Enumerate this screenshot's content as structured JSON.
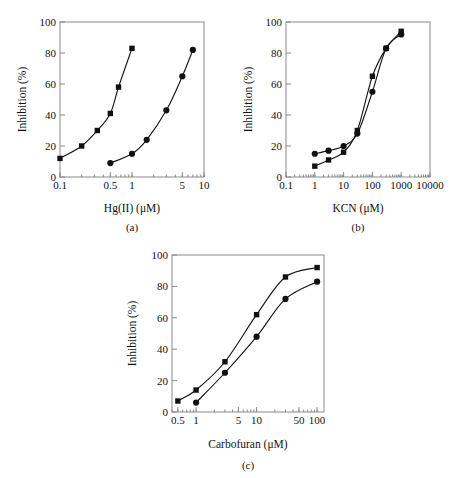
{
  "figure": {
    "ylabel": "Inhibition (%)",
    "ylim": [
      0,
      100
    ],
    "yticks": [
      0,
      20,
      40,
      60,
      80,
      100
    ]
  },
  "chart_data": [
    {
      "id": "a",
      "type": "scatter",
      "panel_label": "(a)",
      "title": "",
      "xlabel": "Hg(II) (μM)",
      "ylabel": "Inhibition (%)",
      "xscale": "log",
      "xlim": [
        0.1,
        10
      ],
      "ylim": [
        0,
        100
      ],
      "xticks": [
        0.1,
        0.5,
        1,
        5,
        10
      ],
      "xtick_labels": [
        "0.1",
        "0.5",
        "1",
        "5",
        "10"
      ],
      "yticks": [
        0,
        20,
        40,
        60,
        80,
        100
      ],
      "ytick_labels": [
        "0",
        "20",
        "40",
        "60",
        "80",
        "100"
      ],
      "grid": false,
      "legend": "none",
      "series": [
        {
          "name": "series-square",
          "marker": "square",
          "x": [
            0.1,
            0.2,
            0.33,
            0.5,
            0.65,
            1.0
          ],
          "values": [
            12,
            20,
            30,
            41,
            58,
            83
          ]
        },
        {
          "name": "series-circle",
          "marker": "circle",
          "x": [
            0.5,
            1.0,
            1.6,
            3.0,
            5.0,
            7.0
          ],
          "values": [
            9,
            15,
            24,
            43,
            65,
            82
          ]
        }
      ]
    },
    {
      "id": "b",
      "type": "scatter",
      "panel_label": "(b)",
      "title": "",
      "xlabel": "KCN (μM)",
      "ylabel": "Inhibition (%)",
      "xscale": "log",
      "xlim": [
        0.1,
        10000
      ],
      "ylim": [
        0,
        100
      ],
      "xticks": [
        0.1,
        1,
        10,
        100,
        1000,
        10000
      ],
      "xtick_labels": [
        "0.1",
        "1",
        "10",
        "100",
        "1000",
        "10000"
      ],
      "yticks": [
        0,
        20,
        40,
        60,
        80,
        100
      ],
      "ytick_labels": [
        "0",
        "20",
        "40",
        "60",
        "80",
        "100"
      ],
      "grid": false,
      "legend": "none",
      "series": [
        {
          "name": "series-square",
          "marker": "square",
          "x": [
            1,
            3,
            10,
            30,
            100,
            300,
            1000
          ],
          "values": [
            7,
            11,
            16,
            30,
            65,
            83,
            94
          ]
        },
        {
          "name": "series-circle",
          "marker": "circle",
          "x": [
            1,
            3,
            10,
            30,
            100,
            300,
            1000
          ],
          "values": [
            15,
            17,
            20,
            28,
            55,
            83,
            92
          ]
        }
      ]
    },
    {
      "id": "c",
      "type": "scatter",
      "panel_label": "(c)",
      "title": "",
      "xlabel": "Carbofuran (μM)",
      "ylabel": "Inhibition (%)",
      "xscale": "log",
      "xlim": [
        0.4,
        130
      ],
      "ylim": [
        0,
        100
      ],
      "xticks": [
        0.5,
        1,
        5,
        10,
        50,
        100
      ],
      "xtick_labels": [
        "0.5",
        "1",
        "5",
        "10",
        "50",
        "100"
      ],
      "yticks": [
        0,
        20,
        40,
        60,
        80,
        100
      ],
      "ytick_labels": [
        "0",
        "20",
        "40",
        "60",
        "80",
        "100"
      ],
      "grid": false,
      "legend": "none",
      "series": [
        {
          "name": "series-square",
          "marker": "square",
          "x": [
            0.5,
            1,
            3,
            10,
            30,
            100
          ],
          "values": [
            7,
            14,
            32,
            62,
            86,
            92
          ]
        },
        {
          "name": "series-circle",
          "marker": "circle",
          "x": [
            1,
            3,
            10,
            30,
            100
          ],
          "values": [
            6,
            25,
            48,
            72,
            83
          ]
        }
      ]
    }
  ]
}
